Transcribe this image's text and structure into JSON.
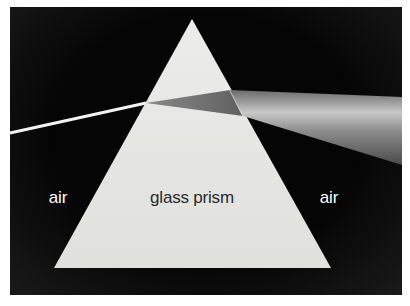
{
  "figure": {
    "title": "",
    "labels": {
      "left_medium": "air",
      "prism": "glass prism",
      "right_medium": "air"
    },
    "colors": {
      "background": "#050505",
      "prism_fill": "#e6e6e3",
      "incident_ray": "#f2f2f2",
      "dispersed_beam": "#9a9a9a"
    }
  }
}
